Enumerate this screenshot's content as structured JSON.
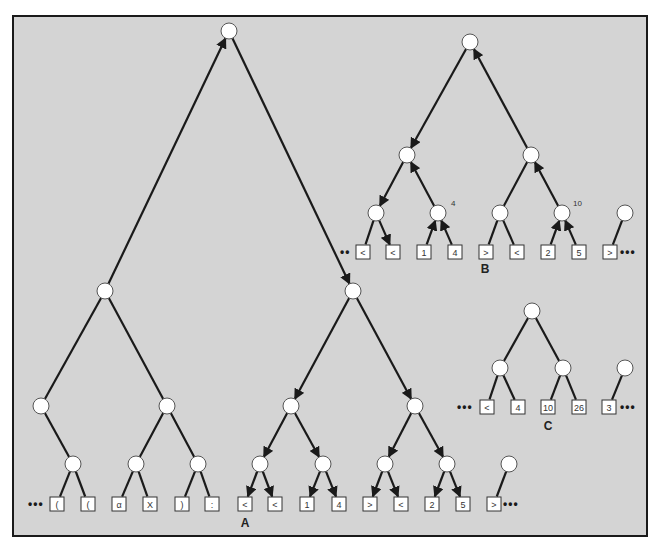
{
  "diagram": {
    "colors": {
      "background": "#d4d4d4",
      "frame": "#1a1a1a",
      "node_fill": "#ffffff",
      "edge": "#1a1a1a"
    },
    "panels": [
      {
        "id": "A",
        "label": "A",
        "leaves": [
          "(",
          "(",
          "α",
          "X",
          ")",
          ":",
          "<",
          "<",
          "1",
          "4",
          ">",
          "<",
          "2",
          "5",
          ">"
        ],
        "leading_ellipsis": "•••",
        "trailing_ellipsis": "•••"
      },
      {
        "id": "B",
        "label": "B",
        "leaves": [
          "<",
          "<",
          "1",
          "4",
          ">",
          "<",
          "2",
          "5",
          ">"
        ],
        "annotations": [
          "4",
          "10"
        ],
        "leading_ellipsis": "••",
        "trailing_ellipsis": "•••"
      },
      {
        "id": "C",
        "label": "C",
        "leaves": [
          "<",
          "4",
          "10",
          "26",
          "3"
        ],
        "leading_ellipsis": "•••",
        "trailing_ellipsis": "•••"
      }
    ]
  }
}
